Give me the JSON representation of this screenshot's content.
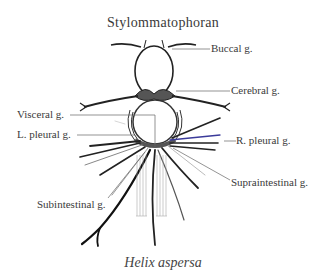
{
  "figure": {
    "title": "Stylommatophoran",
    "caption": "Helix aspersa",
    "labels": {
      "buccal": "Buccal g.",
      "cerebral": "Cerebral g.",
      "visceral": "Visceral g.",
      "l_pleural": "L. pleural g.",
      "r_pleural": "R. pleural g.",
      "supraintestinal": "Supraintestinal g.",
      "subintestinal": "Subintestinal g."
    }
  }
}
